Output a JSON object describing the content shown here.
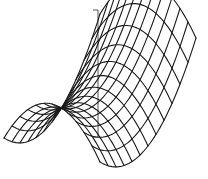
{
  "figure": {
    "width": 208,
    "height": 179,
    "background": "#ffffff",
    "line_color": "#1a1a1a",
    "axis_color": "#555555"
  },
  "chart_data": {
    "type": "wireframe-3d",
    "surface": "saddle (hyperbolic paraboloid) z = x^2 - y^2",
    "title": "",
    "xlabel": "",
    "ylabel": "",
    "zlabel": "",
    "grid_lines_u": 13,
    "grid_lines_v": 13,
    "domain": {
      "u": [
        -1,
        1
      ],
      "v": [
        -1,
        1
      ]
    },
    "z_axis": {
      "x": 98,
      "top": 10,
      "bottom": 137,
      "tick_len": 5
    },
    "projection": {
      "origin": [
        100,
        88
      ],
      "u_vec": [
        -48,
        62
      ],
      "v_vec": [
        48,
        12
      ],
      "z_vec": [
        0,
        -46
      ]
    },
    "ticks": [],
    "legend": []
  }
}
